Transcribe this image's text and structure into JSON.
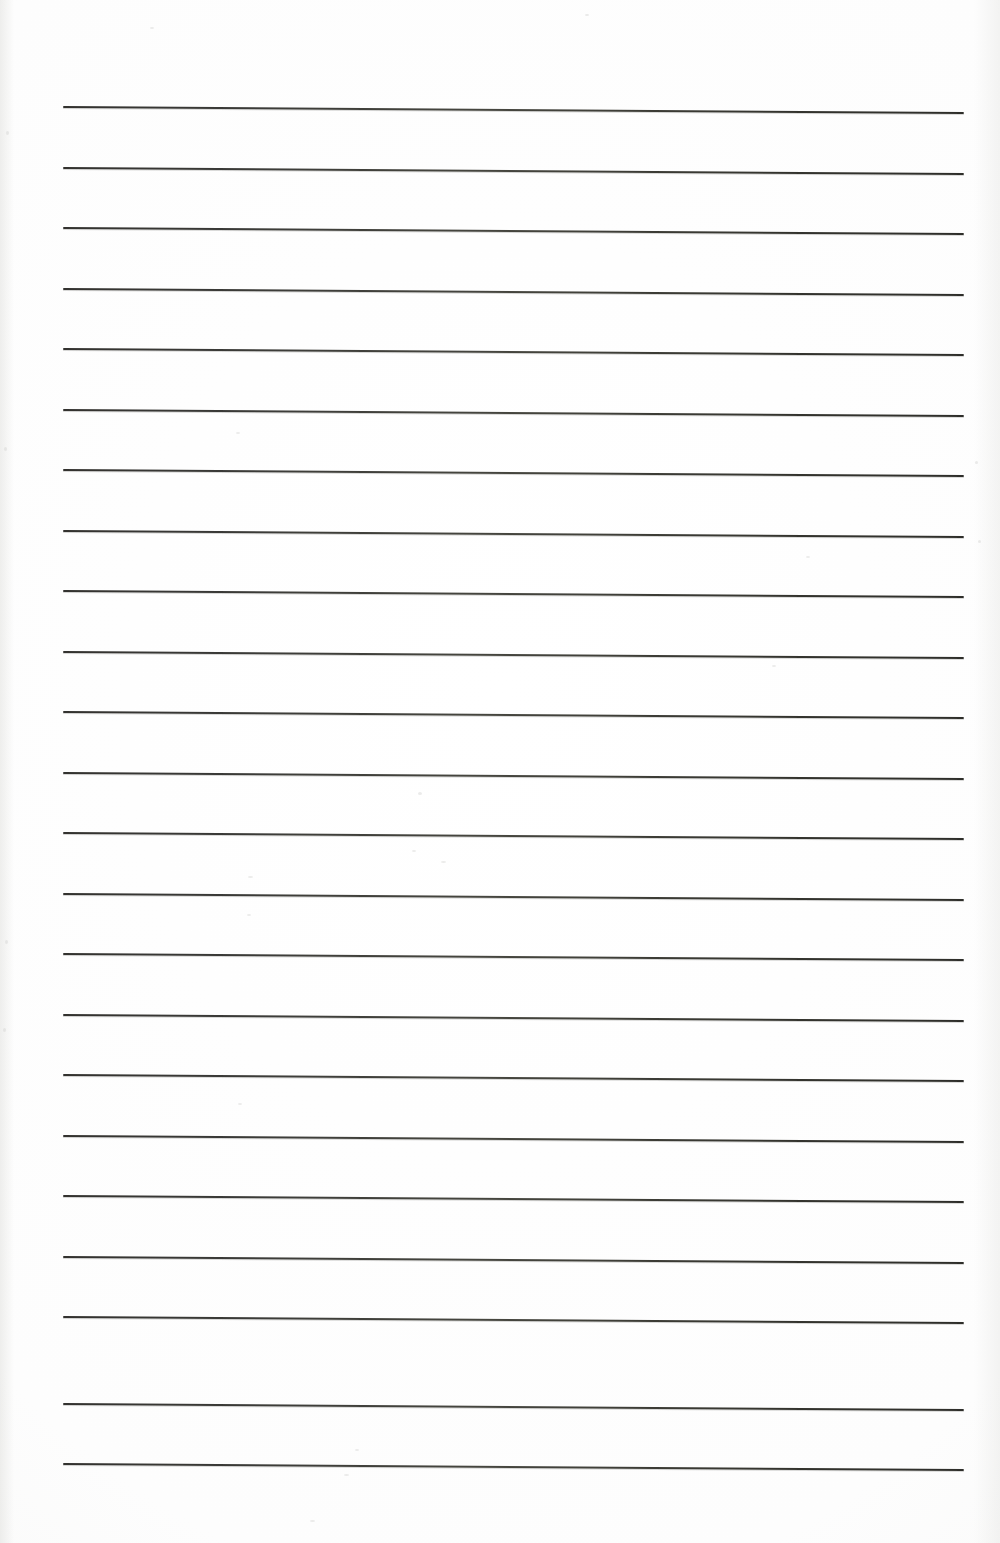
{
  "document": {
    "kind": "scanned-lined-paper",
    "title": "Blank Ruled Paper (Scanned)",
    "description": "A scanned blank sheet of ruled writing paper with no handwriting or printed text.",
    "page_width_px": 1000,
    "page_height_px": 1543,
    "background_color": "#fefefe",
    "rule_color": "#3a3a37",
    "rule_thickness_px": 2,
    "rule_count": 23,
    "rule_left_x_px": 63,
    "rule_right_x_px": 964,
    "rule_spacing_px": 60.5,
    "rule_skew_deg": 0.38,
    "visible_text": "",
    "margin_rule_present": false
  },
  "rules": {
    "left_x": 63,
    "right_x": 964,
    "skew_drop_px": 6,
    "y_positions": [
      106,
      167,
      227,
      288,
      348,
      409,
      469,
      530,
      590,
      651,
      711,
      772,
      832,
      893,
      953,
      1014,
      1074,
      1135,
      1195,
      1256,
      1316,
      1403,
      1463
    ]
  },
  "artifacts": {
    "label": "scan-speckles",
    "specks": [
      {
        "x": 236,
        "y": 432,
        "w": 4,
        "h": 2
      },
      {
        "x": 248,
        "y": 876,
        "w": 5,
        "h": 2
      },
      {
        "x": 247,
        "y": 914,
        "w": 4,
        "h": 2
      },
      {
        "x": 238,
        "y": 1103,
        "w": 4,
        "h": 2
      },
      {
        "x": 418,
        "y": 792,
        "w": 4,
        "h": 3
      },
      {
        "x": 412,
        "y": 850,
        "w": 4,
        "h": 2
      },
      {
        "x": 441,
        "y": 861,
        "w": 5,
        "h": 2
      },
      {
        "x": 344,
        "y": 1474,
        "w": 5,
        "h": 2
      },
      {
        "x": 806,
        "y": 556,
        "w": 4,
        "h": 2
      },
      {
        "x": 772,
        "y": 665,
        "w": 4,
        "h": 2
      },
      {
        "x": 978,
        "y": 540,
        "w": 3,
        "h": 3
      },
      {
        "x": 975,
        "y": 461,
        "w": 3,
        "h": 3
      },
      {
        "x": 6,
        "y": 131,
        "w": 3,
        "h": 4
      },
      {
        "x": 4,
        "y": 447,
        "w": 3,
        "h": 4
      },
      {
        "x": 5,
        "y": 940,
        "w": 3,
        "h": 4
      },
      {
        "x": 3,
        "y": 1028,
        "w": 3,
        "h": 4
      },
      {
        "x": 150,
        "y": 27,
        "w": 4,
        "h": 2
      },
      {
        "x": 585,
        "y": 14,
        "w": 4,
        "h": 2
      },
      {
        "x": 355,
        "y": 1449,
        "w": 4,
        "h": 2
      },
      {
        "x": 310,
        "y": 1520,
        "w": 5,
        "h": 2
      }
    ]
  }
}
